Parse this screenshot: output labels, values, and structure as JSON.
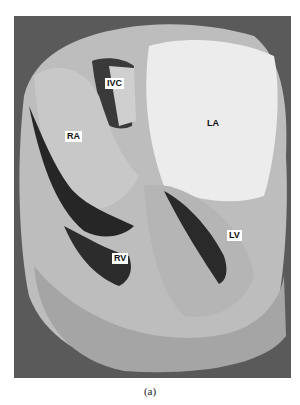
{
  "figure": {
    "caption": "(a)",
    "labels": {
      "ivc": "IVC",
      "ra": "RA",
      "la": "LA",
      "lv": "LV",
      "rv": "RV"
    }
  }
}
